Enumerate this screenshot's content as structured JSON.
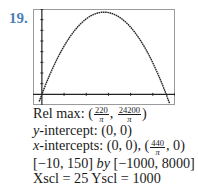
{
  "problem_number": "19.",
  "graph": {
    "function": "y = 220x - (pi/2)x^2",
    "xmin": -10,
    "xmax": 150,
    "ymin": -1000,
    "ymax": 8000,
    "xscl": 25,
    "yscl": 1000
  },
  "chart_data": {
    "type": "line",
    "title": "",
    "xlabel": "",
    "ylabel": "",
    "xlim": [
      -10,
      150
    ],
    "ylim": [
      -1000,
      8000
    ],
    "xscl": 25,
    "yscl": 1000,
    "grid": false,
    "series": [
      {
        "name": "y = 220x - (π/2)x²",
        "x": [
          -5,
          0,
          10,
          20,
          30,
          40,
          50,
          60,
          70,
          80,
          90,
          100,
          110,
          120,
          130,
          140,
          145
        ],
        "y": [
          -1139,
          0,
          2043,
          3772,
          5186,
          6287,
          7073,
          7545,
          7703,
          7547,
          7077,
          6292,
          5194,
          3781,
          2055,
          15,
          -1133
        ]
      }
    ],
    "annotations": [
      "Rel max: (220/π, 24200/π)",
      "y-intercept: (0, 0)",
      "x-intercepts: (0, 0), (440/π, 0)"
    ]
  },
  "text": {
    "relmax_label": "Rel max: (",
    "relmax_x_num": "220",
    "relmax_x_den": "π",
    "relmax_sep": ", ",
    "relmax_y_num": "24200",
    "relmax_y_den": "π",
    "relmax_close": ")",
    "yint_var": "y",
    "yint_rest": "-intercept: (0, 0)",
    "xint_var": "x",
    "xint_rest": "-intercepts: (0, 0), (",
    "xint_num": "440",
    "xint_den": "π",
    "xint_close": ", 0)",
    "window_x": "[−10, 150] ",
    "window_by": "by",
    "window_y": " [−1000, 8000]",
    "scale": "Xscl = 25 Yscl = 1000"
  }
}
